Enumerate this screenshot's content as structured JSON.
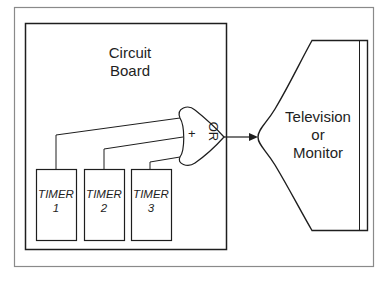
{
  "board": {
    "title_line1": "Circuit",
    "title_line2": "Board"
  },
  "timers": [
    {
      "name": "TIMER",
      "number": "1"
    },
    {
      "name": "TIMER",
      "number": "2"
    },
    {
      "name": "TIMER",
      "number": "3"
    }
  ],
  "gate": {
    "label": "OR",
    "symbol": "+"
  },
  "display": {
    "line1": "Television",
    "line2": "or",
    "line3": "Monitor"
  },
  "colors": {
    "stroke": "#1e1e1e",
    "frame": "#7a7a7a",
    "background": "#ffffff"
  }
}
